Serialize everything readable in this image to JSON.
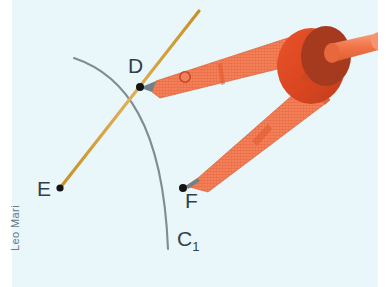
{
  "figure": {
    "type": "geometry-illustration",
    "background_color": "#e9f6fa",
    "watermark_text": "Leo Mari"
  },
  "labels": {
    "D": "D",
    "E": "E",
    "F": "F",
    "C1_base": "C",
    "C1_sub": "1"
  },
  "colors": {
    "ray_orange": "#d89a2e",
    "arc_gray": "#7b8a90",
    "point_black": "#1a1a1a",
    "compass_leg": "#f0784e",
    "compass_leg_dark": "#e0572a",
    "compass_body": "#e04a22",
    "compass_body_dark": "#a63a1e",
    "compass_knob": "#f4794c",
    "label_text": "#333f47"
  },
  "geometry": {
    "vertex_E": [
      60,
      188
    ],
    "point_D": [
      140,
      87
    ],
    "point_F": [
      183,
      188
    ],
    "ray_horizontal_end": [
      296,
      188
    ],
    "ray_upper_end": [
      199,
      11
    ],
    "arc_start": [
      74,
      58
    ],
    "arc_end": [
      168,
      249
    ],
    "arc_label": "C1"
  }
}
